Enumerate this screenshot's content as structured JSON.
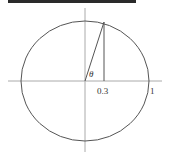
{
  "diagram": {
    "type": "unit-circle",
    "labels": {
      "angle": "θ",
      "x_value": "0.3",
      "radius_mark": "1"
    },
    "colors": {
      "stroke": "#555555",
      "axis": "#aaaaaa",
      "text": "#333333",
      "topbar": "#2a2a2a"
    }
  }
}
